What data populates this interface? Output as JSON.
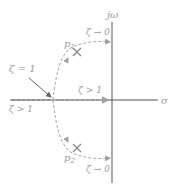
{
  "diagram": {
    "title": "",
    "axes": {
      "imag_label": "jω",
      "real_label": "σ"
    },
    "poles": [
      {
        "name": "p1",
        "label": "p",
        "sub": "1"
      },
      {
        "name": "p2",
        "label": "p",
        "sub": "2"
      }
    ],
    "annotations": {
      "zeta_eq_1": "ζ = 1",
      "zeta_gt_1_right": "ζ > 1",
      "zeta_gt_1_left": "ζ > 1",
      "zeta_to_0_upper": "ζ → 0",
      "zeta_to_0_lower": "ζ → 0"
    },
    "colors": {
      "axis": "#555555",
      "locus": "#a0a0a0",
      "text": "#9a9a9a",
      "pole": "#888888"
    }
  }
}
